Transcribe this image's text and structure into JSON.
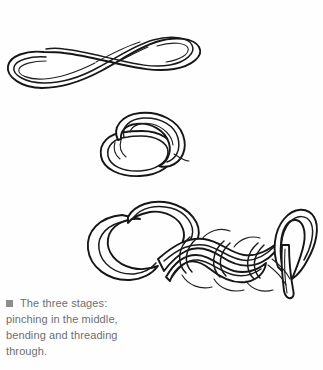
{
  "page": {
    "background_color": "#fefefe",
    "width": 323,
    "height": 370
  },
  "illustrations": {
    "ink_color": "#161616",
    "fill_color": "#ffffff",
    "items": [
      {
        "id": "pinched-bight",
        "stage": 1,
        "title": "Rope pinched in the middle",
        "description": "A length of rope doubled back on itself forming a long flattened loop with rounded ends and a narrow waist in the middle."
      },
      {
        "id": "folded-loop",
        "stage": 2,
        "title": "Rope bent into a loop",
        "description": "The pinched rope bent around so the two bights overlap, forming a compact coiled loop."
      },
      {
        "id": "braided-knot",
        "stage": 3,
        "title": "Rope threaded through",
        "description": "The finished braided chain sinnet with interlocking loops and the working end threaded through the final bight."
      }
    ]
  },
  "caption": {
    "bullet_icon": "square-bullet-icon",
    "bullet_color": "#8d8d8d",
    "text_color": "#6e6e6e",
    "lines": [
      "The three stages:",
      "pinching in the middle,",
      "bending and threading",
      "through."
    ],
    "full_text": "The three stages: pinching in the middle, bending and threading through."
  }
}
